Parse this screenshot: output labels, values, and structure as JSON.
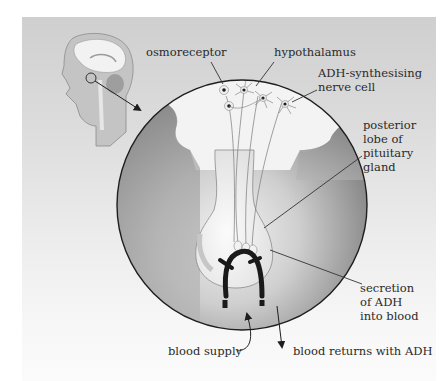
{
  "diagram": {
    "type": "anatomical-illustration",
    "labels": {
      "osmoreceptor": "osmoreceptor",
      "hypothalamus": "hypothalamus",
      "adh_cell_line1": "ADH-synthesising",
      "adh_cell_line2": "nerve cell",
      "posterior_line1": "posterior",
      "posterior_line2": "lobe of",
      "posterior_line3": "pituitary",
      "posterior_line4": "gland",
      "secretion_line1": "secretion",
      "secretion_line2": "of ADH",
      "secretion_line3": "into blood",
      "blood_supply": "blood supply",
      "blood_returns": "blood returns with ADH"
    },
    "colors": {
      "panel_top": "#cfcfcf",
      "outline": "#1e1e1e",
      "vessel": "#1a1a1a",
      "tissue_light": "#f4f4f4",
      "tissue_dark": "#8a8a8a"
    }
  }
}
